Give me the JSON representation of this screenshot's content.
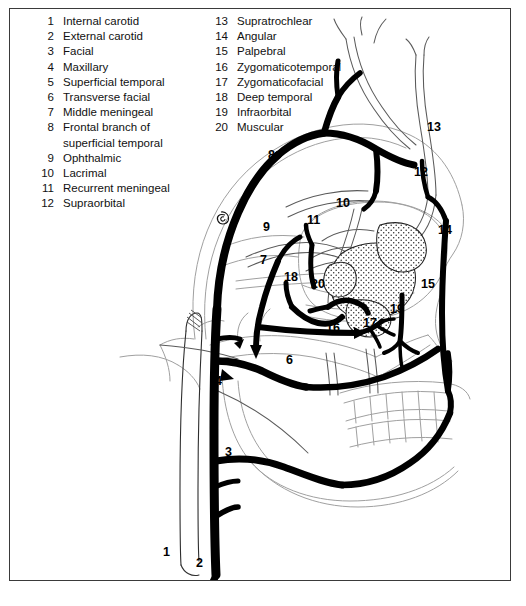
{
  "figure": {
    "frame_color": "#3a3a3a",
    "artery_color": "#000000",
    "bone_outline_color": "#9a9a9a",
    "background": "#ffffff"
  },
  "legend": {
    "left_column": [
      {
        "num": "1",
        "label": "Internal carotid"
      },
      {
        "num": "2",
        "label": "External carotid"
      },
      {
        "num": "3",
        "label": "Facial"
      },
      {
        "num": "4",
        "label": "Maxillary"
      },
      {
        "num": "5",
        "label": "Superficial temporal"
      },
      {
        "num": "6",
        "label": "Transverse facial"
      },
      {
        "num": "7",
        "label": "Middle meningeal"
      },
      {
        "num": "8",
        "label": "Frontal branch of superficial temporal"
      },
      {
        "num": "9",
        "label": "Ophthalmic"
      },
      {
        "num": "10",
        "label": "Lacrimal"
      },
      {
        "num": "11",
        "label": "Recurrent meningeal"
      },
      {
        "num": "12",
        "label": "Supraorbital"
      }
    ],
    "right_column": [
      {
        "num": "13",
        "label": "Supratrochlear"
      },
      {
        "num": "14",
        "label": "Angular"
      },
      {
        "num": "15",
        "label": "Palpebral"
      },
      {
        "num": "16",
        "label": "Zygomaticotemporal"
      },
      {
        "num": "17",
        "label": "Zygomaticofacial"
      },
      {
        "num": "18",
        "label": "Deep temporal"
      },
      {
        "num": "19",
        "label": "Infraorbital"
      },
      {
        "num": "20",
        "label": "Muscular"
      }
    ]
  },
  "markers": [
    {
      "id": "1",
      "x": 163,
      "y": 556,
      "name": "internal-carotid"
    },
    {
      "id": "2",
      "x": 196,
      "y": 567,
      "name": "external-carotid"
    },
    {
      "id": "3",
      "x": 225,
      "y": 456,
      "name": "facial"
    },
    {
      "id": "4",
      "x": 215,
      "y": 385,
      "name": "maxillary"
    },
    {
      "id": "5",
      "x": 212,
      "y": 341,
      "name": "superficial-temporal"
    },
    {
      "id": "6",
      "x": 286,
      "y": 364,
      "name": "transverse-facial"
    },
    {
      "id": "7",
      "x": 260,
      "y": 264,
      "name": "middle-meningeal"
    },
    {
      "id": "8",
      "x": 268,
      "y": 159,
      "name": "frontal-branch-superficial-temporal"
    },
    {
      "id": "9",
      "x": 263,
      "y": 231,
      "name": "ophthalmic"
    },
    {
      "id": "10",
      "x": 336,
      "y": 207,
      "name": "lacrimal"
    },
    {
      "id": "11",
      "x": 307,
      "y": 224,
      "name": "recurrent-meningeal"
    },
    {
      "id": "12",
      "x": 414,
      "y": 176,
      "name": "supraorbital"
    },
    {
      "id": "13",
      "x": 427,
      "y": 131,
      "name": "supratrochlear"
    },
    {
      "id": "14",
      "x": 438,
      "y": 234,
      "name": "angular"
    },
    {
      "id": "15",
      "x": 421,
      "y": 288,
      "name": "palpebral"
    },
    {
      "id": "16",
      "x": 326,
      "y": 332,
      "name": "zygomaticotemporal"
    },
    {
      "id": "17",
      "x": 363,
      "y": 327,
      "name": "zygomaticofacial"
    },
    {
      "id": "18",
      "x": 284,
      "y": 281,
      "name": "deep-temporal"
    },
    {
      "id": "19",
      "x": 390,
      "y": 313,
      "name": "infraorbital"
    },
    {
      "id": "20",
      "x": 311,
      "y": 288,
      "name": "muscular"
    }
  ]
}
